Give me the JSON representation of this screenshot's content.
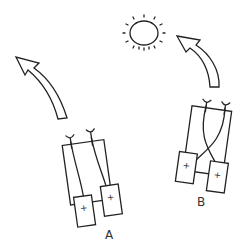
{
  "diagram": {
    "light_source": {
      "icon": "sun-icon"
    },
    "vehicles": [
      {
        "id": "A",
        "label": "A",
        "wiring": "uncrossed (ipsilateral) sensor-to-motor connections",
        "motors": [
          {
            "sign": "+"
          },
          {
            "sign": "+"
          }
        ],
        "path_arrow": "curved arrow turning away up-left"
      },
      {
        "id": "B",
        "label": "B",
        "wiring": "crossed (contralateral) sensor-to-motor connections",
        "motors": [
          {
            "sign": "+"
          },
          {
            "sign": "+"
          }
        ],
        "path_arrow": "curved arrow turning toward the sun"
      }
    ]
  },
  "colors": {
    "stroke": "#222222",
    "background": "#ffffff"
  }
}
